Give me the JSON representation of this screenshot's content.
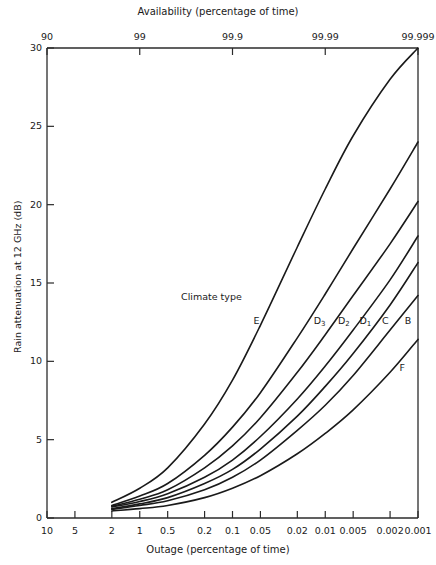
{
  "chart_data": {
    "type": "line",
    "title": "",
    "xlabel": "Outage (percentage of time)",
    "ylabel": "Rain attenuation at 12 GHz (dB)",
    "top_axis_label": "Availability (percentage of time)",
    "legend_title": "Climate type",
    "grid": false,
    "legend_position": "inline-curve-labels",
    "x_scale": "log-reversed",
    "xlim": [
      10,
      0.001
    ],
    "ylim": [
      0,
      30
    ],
    "x_ticks": [
      "10",
      "5",
      "2",
      "1",
      "0.5",
      "0.2",
      "0.1",
      "0.05",
      "0.02",
      "0.01",
      "0.005",
      "0.002",
      "0.001"
    ],
    "x_tick_values": [
      10,
      5,
      2,
      1,
      0.5,
      0.2,
      0.1,
      0.05,
      0.02,
      0.01,
      0.005,
      0.002,
      0.001
    ],
    "top_ticks": [
      "90",
      "99",
      "99.9",
      "99.99",
      "99.999"
    ],
    "top_tick_values": [
      10,
      1,
      0.1,
      0.01,
      0.001
    ],
    "y_ticks": [
      "0",
      "5",
      "10",
      "15",
      "20",
      "25",
      "30"
    ],
    "y_tick_values": [
      0,
      5,
      10,
      15,
      20,
      25,
      30
    ],
    "series": [
      {
        "name": "E",
        "label": "E",
        "label_x": 0.055,
        "label_y": 12.6,
        "x": [
          2,
          1,
          0.5,
          0.2,
          0.1,
          0.05,
          0.02,
          0.01,
          0.005,
          0.002,
          0.001
        ],
        "values": [
          1.0,
          1.9,
          3.2,
          6.0,
          8.8,
          12.3,
          17.3,
          21.0,
          24.4,
          28.0,
          30.0
        ]
      },
      {
        "name": "D3",
        "label": "D₃",
        "label_x": 0.0115,
        "label_y": 12.6,
        "x": [
          2,
          1,
          0.5,
          0.2,
          0.1,
          0.05,
          0.02,
          0.01,
          0.005,
          0.002,
          0.001
        ],
        "values": [
          0.8,
          1.4,
          2.2,
          4.0,
          5.8,
          8.0,
          11.5,
          14.3,
          17.2,
          21.0,
          24.0
        ]
      },
      {
        "name": "D2",
        "label": "D₂",
        "label_x": 0.0063,
        "label_y": 12.6,
        "x": [
          2,
          1,
          0.5,
          0.2,
          0.1,
          0.05,
          0.02,
          0.01,
          0.005,
          0.002,
          0.001
        ],
        "values": [
          0.75,
          1.2,
          1.8,
          3.2,
          4.6,
          6.4,
          9.3,
          11.7,
          14.2,
          17.5,
          20.2
        ]
      },
      {
        "name": "D1",
        "label": "D₁",
        "label_x": 0.0037,
        "label_y": 12.6,
        "x": [
          2,
          1,
          0.5,
          0.2,
          0.1,
          0.05,
          0.02,
          0.01,
          0.005,
          0.002,
          0.001
        ],
        "values": [
          0.7,
          1.05,
          1.55,
          2.6,
          3.7,
          5.2,
          7.6,
          9.7,
          12.0,
          15.2,
          18.0
        ]
      },
      {
        "name": "C",
        "label": "C",
        "label_x": 0.00225,
        "label_y": 12.6,
        "x": [
          2,
          1,
          0.5,
          0.2,
          0.1,
          0.05,
          0.02,
          0.01,
          0.005,
          0.002,
          0.001
        ],
        "values": [
          0.6,
          0.9,
          1.3,
          2.2,
          3.1,
          4.4,
          6.5,
          8.4,
          10.5,
          13.6,
          16.3
        ]
      },
      {
        "name": "B",
        "label": "B",
        "label_x": 0.00128,
        "label_y": 12.6,
        "x": [
          2,
          1,
          0.5,
          0.2,
          0.1,
          0.05,
          0.02,
          0.01,
          0.005,
          0.002,
          0.001
        ],
        "values": [
          0.55,
          0.8,
          1.1,
          1.8,
          2.6,
          3.7,
          5.6,
          7.2,
          9.1,
          12.0,
          14.2
        ]
      },
      {
        "name": "F",
        "label": "F",
        "label_x": 0.00148,
        "label_y": 9.6,
        "x": [
          2,
          1,
          0.5,
          0.2,
          0.1,
          0.05,
          0.02,
          0.01,
          0.005,
          0.002,
          0.001
        ],
        "values": [
          0.45,
          0.6,
          0.8,
          1.3,
          1.9,
          2.7,
          4.1,
          5.4,
          6.9,
          9.3,
          11.4
        ]
      }
    ]
  },
  "style": {
    "axis_color": "#2b2b2b",
    "curve_color": "#1a1a1a",
    "background": "#ffffff"
  }
}
